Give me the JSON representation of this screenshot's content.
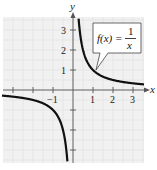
{
  "chart_data": {
    "type": "line",
    "title": "",
    "function": "f(x) = 1/x",
    "label": {
      "lhs": "f(x) =",
      "numerator": "1",
      "denominator": "x"
    },
    "xlabel": "x",
    "ylabel": "y",
    "xlim": [
      -3.5,
      3.5
    ],
    "ylim": [
      -3.6,
      3.6
    ],
    "xticks": [
      -3,
      -2,
      -1,
      1,
      2,
      3
    ],
    "xtick_labels": [
      "",
      "",
      "-1",
      "1",
      "2",
      "3"
    ],
    "yticks": [
      -3,
      -2,
      -1,
      1,
      2,
      3
    ],
    "ytick_labels": [
      "",
      "",
      "",
      "1",
      "2",
      "3"
    ],
    "grid": true,
    "series": [
      {
        "name": "f(x) = 1/x (x>0)",
        "x": [
          0.28,
          0.33,
          0.5,
          0.75,
          1,
          1.5,
          2,
          2.5,
          3,
          3.5
        ],
        "y": [
          3.57,
          3.03,
          2,
          1.33,
          1,
          0.67,
          0.5,
          0.4,
          0.33,
          0.29
        ]
      },
      {
        "name": "f(x) = 1/x (x<0)",
        "x": [
          -3.5,
          -3,
          -2.5,
          -2,
          -1.5,
          -1,
          -0.75,
          -0.5,
          -0.33,
          -0.28
        ],
        "y": [
          -0.29,
          -0.33,
          -0.4,
          -0.5,
          -0.67,
          -1,
          -1.33,
          -2,
          -3.03,
          -3.57
        ]
      }
    ],
    "colors": {
      "curve": "#111111",
      "background": "#f1f1f1",
      "grid": "#e4e4e4",
      "axis": "#555555"
    }
  }
}
